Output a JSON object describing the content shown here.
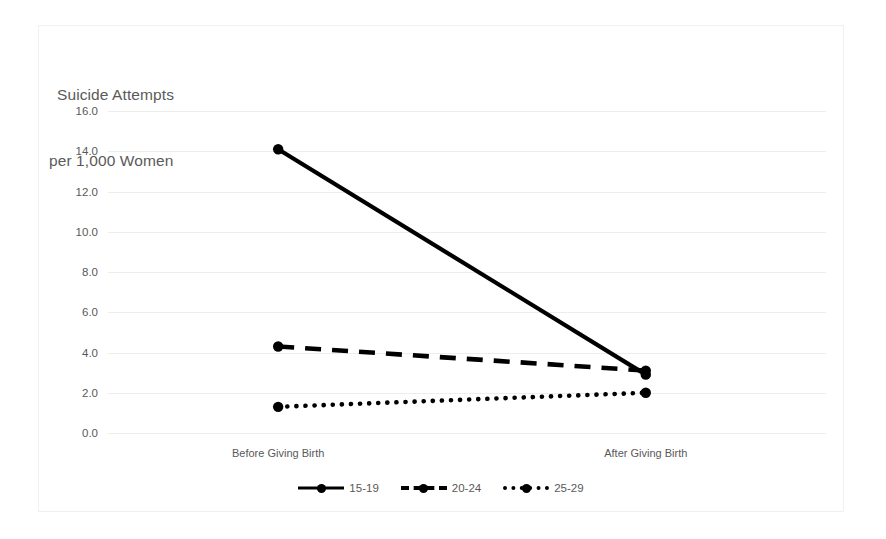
{
  "chart_data": {
    "type": "line",
    "title": "Suicide Attempts per 1,000 Women",
    "title_line1": "Suicide Attempts",
    "title_line2": "per 1,000 Women",
    "xlabel": "",
    "ylabel": "",
    "categories": [
      "Before Giving Birth",
      "After Giving Birth"
    ],
    "ylim": [
      0.0,
      16.0
    ],
    "ytick_step": 2.0,
    "yticks": [
      "16.0",
      "14.0",
      "12.0",
      "10.0",
      "8.0",
      "6.0",
      "4.0",
      "2.0",
      "0.0"
    ],
    "ytick_values": [
      16.0,
      14.0,
      12.0,
      10.0,
      8.0,
      6.0,
      4.0,
      2.0,
      0.0
    ],
    "grid": true,
    "legend_position": "bottom",
    "series": [
      {
        "name": "15-19",
        "style": "solid",
        "color": "#000000",
        "values": [
          14.1,
          2.9
        ]
      },
      {
        "name": "20-24",
        "style": "dashed",
        "color": "#000000",
        "values": [
          4.3,
          3.1
        ]
      },
      {
        "name": "25-29",
        "style": "dotted",
        "color": "#000000",
        "values": [
          1.3,
          2.0
        ]
      }
    ]
  }
}
